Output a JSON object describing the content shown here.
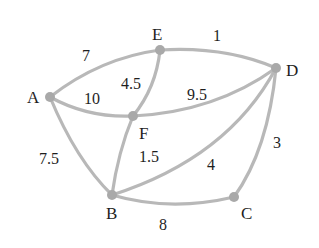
{
  "diagram": {
    "type": "weighted-undirected-graph",
    "nodes": [
      {
        "id": "A",
        "label": "A",
        "x": 50,
        "y": 97
      },
      {
        "id": "E",
        "label": "E",
        "x": 160,
        "y": 50
      },
      {
        "id": "D",
        "label": "D",
        "x": 276,
        "y": 68
      },
      {
        "id": "F",
        "label": "F",
        "x": 133,
        "y": 116
      },
      {
        "id": "B",
        "label": "B",
        "x": 112,
        "y": 195
      },
      {
        "id": "C",
        "label": "C",
        "x": 234,
        "y": 197
      }
    ],
    "edges": [
      {
        "from": "A",
        "to": "E",
        "weight": "7"
      },
      {
        "from": "E",
        "to": "D",
        "weight": "1"
      },
      {
        "from": "E",
        "to": "F",
        "weight": "4.5"
      },
      {
        "from": "A",
        "to": "F",
        "weight": "10"
      },
      {
        "from": "F",
        "to": "D",
        "weight": "9.5"
      },
      {
        "from": "A",
        "to": "B",
        "weight": "7.5"
      },
      {
        "from": "F",
        "to": "B",
        "weight": "1.5"
      },
      {
        "from": "B",
        "to": "D",
        "weight": "4"
      },
      {
        "from": "D",
        "to": "C",
        "weight": "3"
      },
      {
        "from": "B",
        "to": "C",
        "weight": "8"
      }
    ],
    "colors": {
      "edge": "#b8b8b8",
      "node": "#a9a9a9",
      "text": "#1e1e1e",
      "background": "#ffffff"
    }
  }
}
